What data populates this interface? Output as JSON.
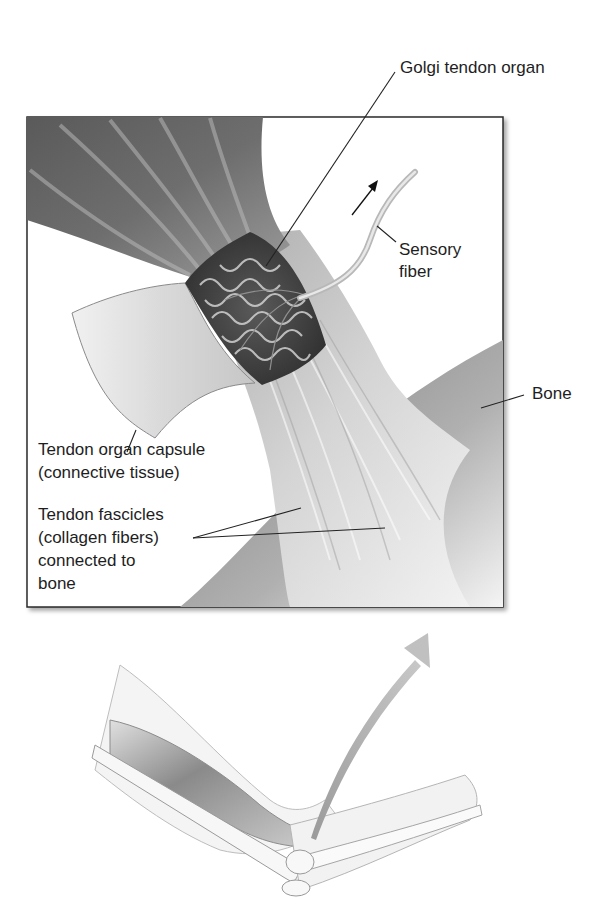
{
  "figure": {
    "inset": {
      "labels": {
        "golgi_tendon_organ": "Golgi tendon organ",
        "sensory_fiber_line1": "Sensory",
        "sensory_fiber_line2": "fiber",
        "bone": "Bone",
        "capsule_line1": "Tendon organ capsule",
        "capsule_line2": "(connective tissue)",
        "fascicles_line1": "Tendon fascicles",
        "fascicles_line2": "(collagen fibers)",
        "fascicles_line3": "connected to",
        "fascicles_line4": "bone"
      },
      "signal_arrow": "afferent-direction-arrow"
    },
    "arm_illustration": {
      "description": "Flexed arm at elbow showing biceps and tendon insertion",
      "arrow": "zoom-callout-arrow"
    },
    "colors": {
      "frame": "#2a2a2a",
      "muscle_dark": "#4a4a4a",
      "muscle_mid": "#7a7a7a",
      "tendon_light": "#d8d8d8",
      "capsule": "#e6e6e6",
      "organ": "#3c3c3c",
      "bone": "#9a9a9a",
      "arrow": "#b5b5b5"
    }
  }
}
